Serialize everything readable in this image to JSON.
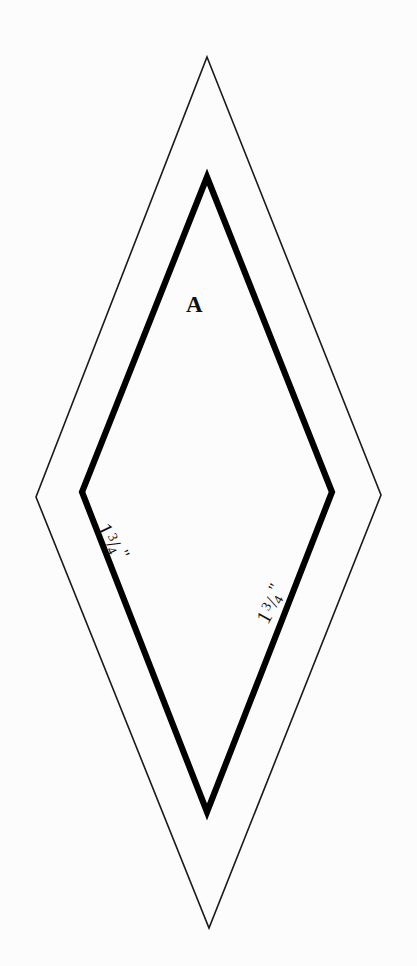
{
  "figure": {
    "background_color": "#fcfcfc",
    "ink_color": "#000000",
    "width": 417,
    "height": 966,
    "shapes": [
      {
        "name": "outer-rhombus",
        "role": "seam-allowance-outline",
        "stroke_color": "#1a1a1a",
        "stroke_width": 1.6,
        "fill": "none",
        "points": "207,57 381,495 209,928 36,497"
      },
      {
        "name": "inner-rhombus",
        "role": "finished-patch-outline",
        "stroke_color": "#000000",
        "stroke_width": 6.2,
        "fill": "none",
        "points": "207,177 332,492 207,812 82,492"
      }
    ]
  },
  "labels": {
    "region": {
      "text": "A",
      "name": "region-label-a"
    },
    "dimension_left": {
      "whole": "1",
      "numerator": "3",
      "bar": "/",
      "denominator": "4",
      "unit": "\"",
      "full_text": "1 3/4\"",
      "rotation_deg": 64
    },
    "dimension_right": {
      "whole": "1",
      "numerator": "3",
      "bar": "/",
      "denominator": "4",
      "unit": "\"",
      "full_text": "1 3/4\"",
      "rotation_deg": -61
    }
  }
}
